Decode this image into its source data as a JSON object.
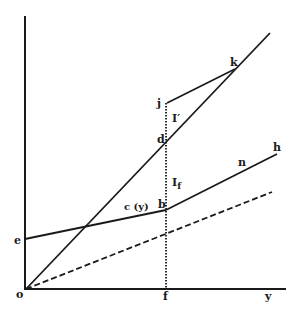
{
  "diagram": {
    "type": "economic-geometry",
    "stroke_color": "#1a1a1a",
    "background": "#ffffff",
    "labels": {
      "origin": "o",
      "e": "e",
      "j": "j",
      "k": "k",
      "d": "d",
      "I_prime": "I′",
      "I_f_main": "I",
      "I_f_sub": "f",
      "c_y": "c (y)",
      "b": "b",
      "n": "n",
      "h": "h",
      "f": "f",
      "y": "y"
    },
    "axes": {
      "vertical": {
        "x": 25,
        "y_top": 16,
        "y_bottom": 289
      },
      "horizontal": {
        "y": 289,
        "x_left": 25,
        "x_right": 286
      }
    }
  }
}
